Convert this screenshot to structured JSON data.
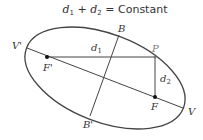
{
  "title": {
    "d1": "d",
    "d1_sub": "1",
    "plus": "+",
    "d2": "d",
    "d2_sub": "2",
    "equals": "=",
    "constant": "Constant"
  },
  "labels": {
    "V_prime": "V'",
    "V": "V",
    "B": "B",
    "B_prime": "B'",
    "F_prime": "F'",
    "F": "F",
    "P": "P",
    "d1": "d",
    "d1_sub": "1",
    "d2": "d",
    "d2_sub": "2"
  },
  "colors": {
    "stroke": "#444444",
    "text": "#333333",
    "background": "#ffffff"
  }
}
